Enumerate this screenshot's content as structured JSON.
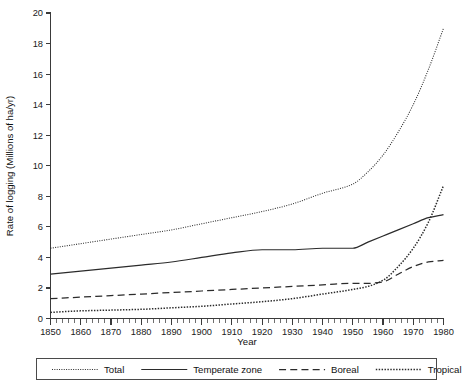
{
  "chart_data": {
    "type": "line",
    "title": "",
    "xlabel": "Year",
    "ylabel": "Rate of logging (Millions of ha/yr)",
    "xlim": [
      1850,
      1980
    ],
    "ylim": [
      0,
      20
    ],
    "xticks": [
      1850,
      1860,
      1870,
      1880,
      1890,
      1900,
      1910,
      1920,
      1930,
      1940,
      1950,
      1960,
      1970,
      1980
    ],
    "yticks": [
      0,
      2,
      4,
      6,
      8,
      10,
      12,
      14,
      16,
      18,
      20
    ],
    "x_minor_tick_step": 2,
    "grid": false,
    "legend_position": "below-axes",
    "x": [
      1850,
      1860,
      1870,
      1880,
      1890,
      1900,
      1910,
      1920,
      1930,
      1940,
      1950,
      1955,
      1960,
      1965,
      1970,
      1975,
      1980
    ],
    "series": [
      {
        "name": "Total",
        "style": "dotted",
        "values": [
          4.6,
          4.9,
          5.2,
          5.5,
          5.8,
          6.2,
          6.6,
          7.0,
          7.5,
          8.2,
          8.8,
          9.6,
          10.7,
          12.2,
          14.0,
          16.3,
          19.0
        ]
      },
      {
        "name": "Temperate zone",
        "style": "solid",
        "values": [
          2.9,
          3.1,
          3.3,
          3.5,
          3.7,
          4.0,
          4.3,
          4.5,
          4.5,
          4.6,
          4.6,
          5.0,
          5.4,
          5.8,
          6.2,
          6.6,
          6.8
        ]
      },
      {
        "name": "Boreal",
        "style": "dashed",
        "values": [
          1.3,
          1.4,
          1.5,
          1.6,
          1.7,
          1.8,
          1.9,
          2.0,
          2.1,
          2.2,
          2.3,
          2.3,
          2.4,
          2.9,
          3.4,
          3.7,
          3.8
        ]
      },
      {
        "name": "Tropical",
        "style": "dotted-bold",
        "values": [
          0.4,
          0.5,
          0.55,
          0.6,
          0.7,
          0.8,
          0.95,
          1.1,
          1.3,
          1.6,
          1.9,
          2.1,
          2.5,
          3.4,
          4.6,
          6.3,
          8.7
        ]
      }
    ],
    "legend_entries": [
      {
        "label": "Total",
        "style": "dotted"
      },
      {
        "label": "Temperate zone",
        "style": "solid"
      },
      {
        "label": "Boreal",
        "style": "dashed"
      },
      {
        "label": "Tropical",
        "style": "dotted-bold"
      }
    ]
  },
  "labels": {
    "x_title": "Year",
    "y_title": "Rate of logging (Millions of ha/yr)"
  }
}
